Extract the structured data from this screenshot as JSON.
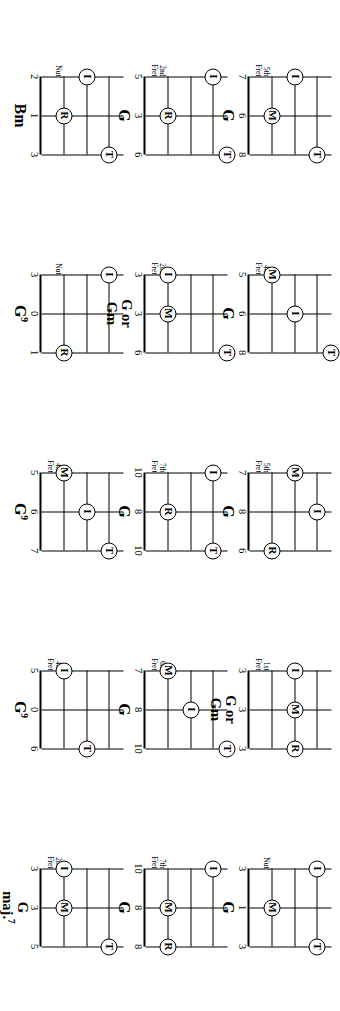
{
  "page": {
    "orientation": "rotated-90",
    "ink_color": "#000000",
    "background_color": "#ffffff",
    "columns": 5,
    "rows": 3,
    "marker_legend": {
      "I": "index finger",
      "M": "middle finger",
      "R": "ring finger",
      "T": "thumb"
    }
  },
  "diagrams": [
    {
      "id": "d-1-1",
      "position_label_line1": "5th",
      "position_label_line2": "Fret",
      "chord_name": "G",
      "chord_sup": "",
      "fret_numbers": [
        "7",
        "6",
        "8"
      ],
      "markers": [
        {
          "label": "I",
          "string": 1,
          "fret_row": 1
        },
        {
          "label": "M",
          "string": 2,
          "fret_row": 2
        },
        {
          "label": "T",
          "string": 3,
          "fret_row": 0
        }
      ]
    },
    {
      "id": "d-1-2",
      "position_label_line1": "2nd",
      "position_label_line2": "Fret",
      "chord_name": "G",
      "chord_sup": "",
      "fret_numbers": [
        "5",
        "3",
        "6"
      ],
      "markers": [
        {
          "label": "I",
          "string": 1,
          "fret_row": 0
        },
        {
          "label": "R",
          "string": 2,
          "fret_row": 2
        },
        {
          "label": "T",
          "string": 3,
          "fret_row": -1
        }
      ]
    },
    {
      "id": "d-1-3",
      "position_label_line1": "",
      "position_label_line2": "Nut",
      "chord_name": "Bm",
      "chord_sup": "",
      "fret_numbers": [
        "2",
        "1",
        "3"
      ],
      "markers": [
        {
          "label": "I",
          "string": 1,
          "fret_row": 1
        },
        {
          "label": "R",
          "string": 2,
          "fret_row": 2
        },
        {
          "label": "T",
          "string": 3,
          "fret_row": 0
        }
      ]
    },
    {
      "id": "d-2-1",
      "position_label_line1": "4th",
      "position_label_line2": "Fret",
      "chord_name": "G",
      "chord_sup": "",
      "fret_numbers": [
        "5",
        "6",
        "8"
      ],
      "markers": [
        {
          "label": "M",
          "string": 1,
          "fret_row": 2
        },
        {
          "label": "I",
          "string": 2,
          "fret_row": 1
        },
        {
          "label": "T",
          "string": 3,
          "fret_row": -1
        }
      ]
    },
    {
      "id": "d-2-2",
      "position_label_line1": "2nd",
      "position_label_line2": "Fret",
      "chord_name": "G or\nGm",
      "chord_sup": "",
      "fret_numbers": [
        "3",
        "3",
        "6"
      ],
      "markers": [
        {
          "label": "I",
          "string": 1,
          "fret_row": 2
        },
        {
          "label": "M",
          "string": 2,
          "fret_row": 2
        },
        {
          "label": "T",
          "string": 3,
          "fret_row": -1
        }
      ]
    },
    {
      "id": "d-2-3",
      "position_label_line1": "",
      "position_label_line2": "Nut",
      "chord_name": "G",
      "chord_sup": "9",
      "fret_numbers": [
        "3",
        "0",
        "1"
      ],
      "markers": [
        {
          "label": "I",
          "string": 1,
          "fret_row": 0
        },
        {
          "label": "R",
          "string": 3,
          "fret_row": 2
        }
      ]
    },
    {
      "id": "d-3-1",
      "position_label_line1": "5th",
      "position_label_line2": "Fret",
      "chord_name": "G",
      "chord_sup": "",
      "fret_numbers": [
        "7",
        "8",
        "6"
      ],
      "markers": [
        {
          "label": "M",
          "string": 1,
          "fret_row": 1
        },
        {
          "label": "I",
          "string": 2,
          "fret_row": 0
        },
        {
          "label": "R",
          "string": 3,
          "fret_row": 2
        }
      ]
    },
    {
      "id": "d-3-2",
      "position_label_line1": "7th",
      "position_label_line2": "Fret",
      "chord_name": "G",
      "chord_sup": "",
      "fret_numbers": [
        "10",
        "8",
        "10"
      ],
      "markers": [
        {
          "label": "I",
          "string": 1,
          "fret_row": 0
        },
        {
          "label": "R",
          "string": 2,
          "fret_row": 2
        },
        {
          "label": "T",
          "string": 3,
          "fret_row": 0
        }
      ]
    },
    {
      "id": "d-3-3",
      "position_label_line1": "4th",
      "position_label_line2": "Fret",
      "chord_name": "G",
      "chord_sup": "9",
      "fret_numbers": [
        "5",
        "6",
        "7"
      ],
      "markers": [
        {
          "label": "M",
          "string": 1,
          "fret_row": 2
        },
        {
          "label": "I",
          "string": 2,
          "fret_row": 1
        },
        {
          "label": "T",
          "string": 3,
          "fret_row": 0
        }
      ]
    },
    {
      "id": "d-4-1",
      "position_label_line1": "1st",
      "position_label_line2": "Fret",
      "chord_name": "G or\nGm",
      "chord_sup": "",
      "fret_numbers": [
        "3",
        "3",
        "3"
      ],
      "markers": [
        {
          "label": "I",
          "string": 1,
          "fret_row": 1
        },
        {
          "label": "M",
          "string": 2,
          "fret_row": 1
        },
        {
          "label": "R",
          "string": 3,
          "fret_row": 1
        }
      ]
    },
    {
      "id": "d-4-2",
      "position_label_line1": "6th",
      "position_label_line2": "Fret",
      "chord_name": "G",
      "chord_sup": "",
      "fret_numbers": [
        "7",
        "8",
        "10"
      ],
      "markers": [
        {
          "label": "M",
          "string": 1,
          "fret_row": 2
        },
        {
          "label": "I",
          "string": 2,
          "fret_row": 1
        },
        {
          "label": "T",
          "string": 3,
          "fret_row": -1
        }
      ]
    },
    {
      "id": "d-4-3",
      "position_label_line1": "4th",
      "position_label_line2": "Fret",
      "chord_name": "G",
      "chord_sup": "9",
      "fret_numbers": [
        "5",
        "0",
        "6"
      ],
      "markers": [
        {
          "label": "I",
          "string": 1,
          "fret_row": 2
        },
        {
          "label": "T",
          "string": 3,
          "fret_row": 1
        }
      ]
    },
    {
      "id": "d-5-1",
      "position_label_line1": "",
      "position_label_line2": "Nut",
      "chord_name": "G",
      "chord_sup": "",
      "fret_numbers": [
        "3",
        "1",
        "3"
      ],
      "markers": [
        {
          "label": "I",
          "string": 1,
          "fret_row": 0
        },
        {
          "label": "M",
          "string": 2,
          "fret_row": 2
        },
        {
          "label": "T",
          "string": 3,
          "fret_row": 0
        }
      ]
    },
    {
      "id": "d-5-2",
      "position_label_line1": "7th",
      "position_label_line2": "Fret",
      "chord_name": "G",
      "chord_sup": "",
      "fret_numbers": [
        "10",
        "8",
        "8"
      ],
      "markers": [
        {
          "label": "I",
          "string": 1,
          "fret_row": 0
        },
        {
          "label": "M",
          "string": 2,
          "fret_row": 2
        },
        {
          "label": "R",
          "string": 3,
          "fret_row": 2
        }
      ]
    },
    {
      "id": "d-5-3",
      "position_label_line1": "2nd",
      "position_label_line2": "Fret",
      "chord_name": "G\nmaj.",
      "chord_sup": "7",
      "fret_numbers": [
        "3",
        "3",
        "5"
      ],
      "markers": [
        {
          "label": "I",
          "string": 1,
          "fret_row": 2
        },
        {
          "label": "M",
          "string": 2,
          "fret_row": 2
        },
        {
          "label": "T",
          "string": 3,
          "fret_row": 0
        }
      ]
    }
  ]
}
